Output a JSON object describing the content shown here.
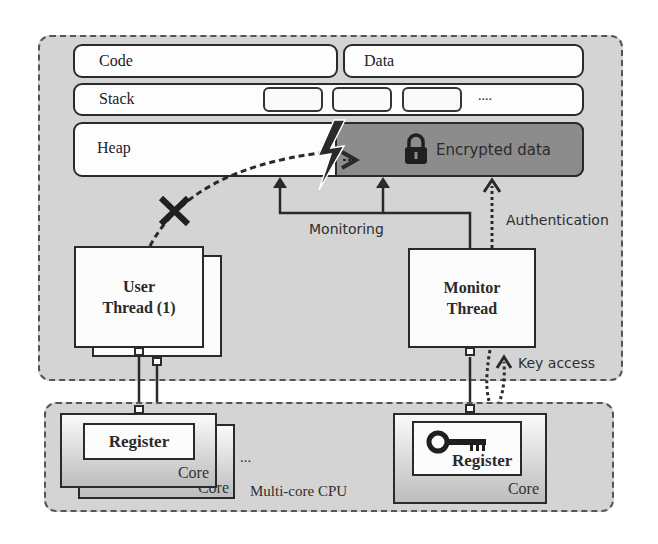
{
  "diagram": {
    "memory": {
      "code_label": "Code",
      "data_label": "Data",
      "stack_label": "Stack",
      "stack_ellipsis": "....",
      "heap_label": "Heap",
      "encrypted_label": "Encrypted data"
    },
    "threads": {
      "user_thread_line1": "User",
      "user_thread_line2": "Thread (1)",
      "monitor_thread_line1": "Monitor",
      "monitor_thread_line2": "Thread"
    },
    "arrows": {
      "monitoring_label": "Monitoring",
      "authentication_label": "Authentication",
      "key_access_label": "Key access"
    },
    "cpu": {
      "register_label_left": "Register",
      "core_label_left": "Core",
      "core_label_left_back": "Core",
      "ellipsis": "...",
      "multicore_label": "Multi-core CPU",
      "register_label_right": "Register",
      "core_label_right": "Core"
    },
    "colors": {
      "background_region": "#d4d4d4",
      "encrypted_region": "#8c8c8c",
      "stroke": "#2a2a2a"
    }
  }
}
